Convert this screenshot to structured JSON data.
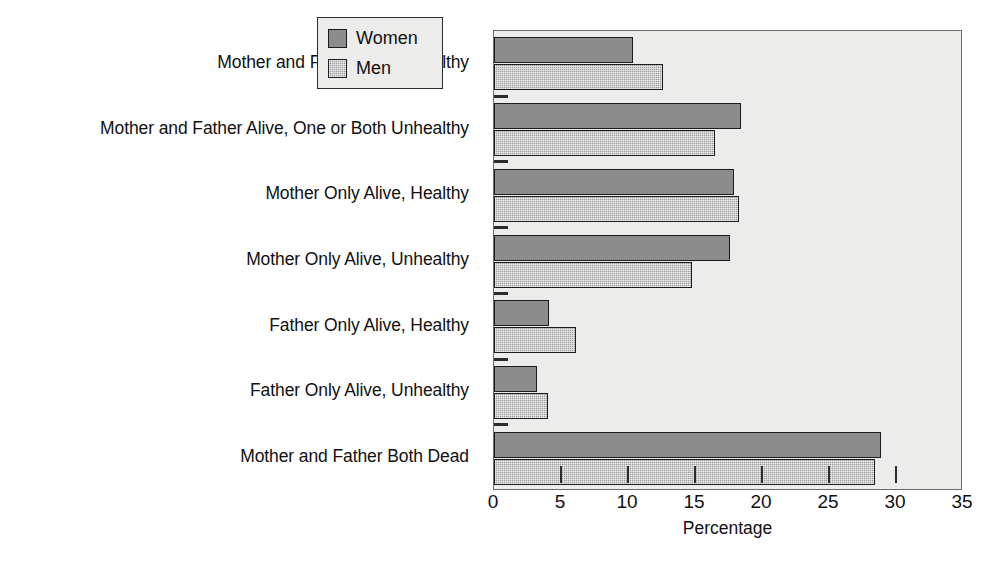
{
  "chart_data": {
    "type": "bar",
    "orientation": "horizontal",
    "title": "",
    "xlabel": "Percentage",
    "ylabel": "",
    "xlim": [
      0,
      35
    ],
    "xticks": [
      0,
      5,
      10,
      15,
      20,
      25,
      30,
      35
    ],
    "xtick_labels": [
      "0",
      "5",
      "10",
      "15",
      "20",
      "25",
      "30",
      "35"
    ],
    "grid": false,
    "legend_position": "top-right",
    "categories": [
      "Mother and Father Alive, Healthy",
      "Mother and Father Alive, One or Both Unhealthy",
      "Mother Only Alive, Healthy",
      "Mother Only Alive, Unhealthy",
      "Father Only Alive, Healthy",
      "Father Only Alive, Unhealthy",
      "Mother and Father Both Dead"
    ],
    "series": [
      {
        "name": "Women",
        "color": "#8c8c8c",
        "values": [
          10.4,
          18.4,
          17.9,
          17.6,
          4.1,
          3.2,
          28.9
        ]
      },
      {
        "name": "Men",
        "color": "#9e9e9e",
        "values": [
          12.6,
          16.5,
          18.3,
          14.8,
          6.1,
          4.0,
          28.4
        ]
      }
    ]
  },
  "legend": {
    "entries": [
      {
        "label": "Women"
      },
      {
        "label": "Men"
      }
    ]
  },
  "axis": {
    "x_title": "Percentage"
  }
}
